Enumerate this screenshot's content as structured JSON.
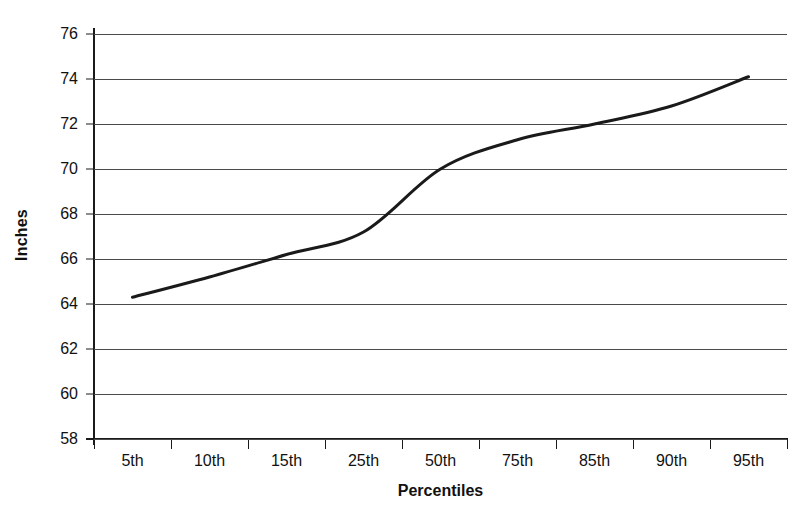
{
  "chart_data": {
    "type": "line",
    "title": "",
    "subtitle": "",
    "xlabel": "Percentiles",
    "ylabel": "Inches",
    "categories": [
      "5th",
      "10th",
      "15th",
      "25th",
      "50th",
      "75th",
      "85th",
      "90th",
      "95th"
    ],
    "values": [
      64.3,
      65.2,
      66.2,
      67.2,
      70.0,
      71.3,
      72.0,
      72.8,
      74.1
    ],
    "series": [
      {
        "name": "Height",
        "values": [
          64.3,
          65.2,
          66.2,
          67.2,
          70.0,
          71.3,
          72.0,
          72.8,
          74.1
        ]
      }
    ],
    "ylim": [
      58,
      76
    ],
    "ytick_values": [
      58,
      60,
      62,
      64,
      66,
      68,
      70,
      72,
      74,
      76
    ],
    "ytick_labels": [
      "58",
      "60",
      "62",
      "64",
      "66",
      "68",
      "70",
      "72",
      "74",
      "76"
    ],
    "grid": true,
    "grid_axis": "y",
    "legend": false,
    "legend_position": "none",
    "line_color": "#1a1a1a",
    "line_width": 3,
    "smoothing": true,
    "markers": false,
    "background_color": "#ffffff",
    "gridline_color": "#4a4a4a",
    "axis_color": "#1a1a1a",
    "text_color": "#111111"
  }
}
